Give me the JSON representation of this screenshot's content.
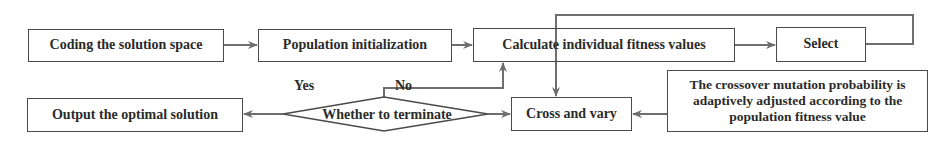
{
  "diagram": {
    "type": "flowchart",
    "colors": {
      "line": "#6e6e6e",
      "border": "#4a4a4a",
      "text": "#2b2b2b",
      "background": "#ffffff"
    },
    "nodes": {
      "coding": {
        "label": "Coding the solution space",
        "shape": "rectangle"
      },
      "population": {
        "label": "Population initialization",
        "shape": "rectangle"
      },
      "fitness": {
        "label": "Calculate individual fitness values",
        "shape": "rectangle"
      },
      "select": {
        "label": "Select",
        "shape": "rectangle"
      },
      "output": {
        "label": "Output the optimal solution",
        "shape": "rectangle"
      },
      "terminate": {
        "label": "Whether to terminate",
        "shape": "diamond"
      },
      "cross": {
        "label": "Cross and vary",
        "shape": "rectangle"
      },
      "adaptive": {
        "label": "The crossover mutation probability is adaptively adjusted according to the population fitness value",
        "shape": "rectangle"
      }
    },
    "edge_labels": {
      "yes": "Yes",
      "no": "No"
    },
    "edges": [
      {
        "from": "coding",
        "to": "population"
      },
      {
        "from": "population",
        "to": "fitness"
      },
      {
        "from": "fitness",
        "to": "select"
      },
      {
        "from": "select",
        "to": "cross"
      },
      {
        "from": "adaptive",
        "to": "cross"
      },
      {
        "from": "terminate",
        "to": "cross"
      },
      {
        "from": "terminate",
        "to": "output",
        "label": "Yes"
      },
      {
        "from": "terminate",
        "to": "fitness",
        "label": "No"
      }
    ]
  }
}
